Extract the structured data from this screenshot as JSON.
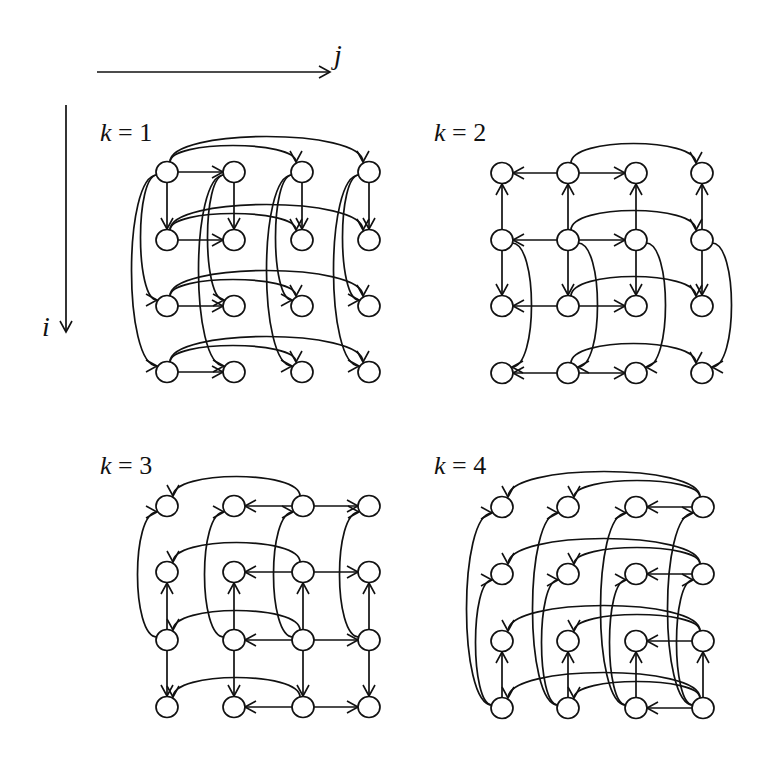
{
  "axes": {
    "j_label": "j",
    "i_label": "i"
  },
  "node_radius": 11,
  "stroke_color": "#111111",
  "panels": [
    {
      "label": "k = 1",
      "label_pos": [
        100,
        141
      ],
      "cols": [
        167,
        234,
        302,
        369
      ],
      "rows": [
        172,
        240,
        306,
        372
      ],
      "edges": [
        {
          "type": "h",
          "from": [
            0,
            0
          ],
          "to": [
            0,
            1
          ]
        },
        {
          "type": "h",
          "from": [
            1,
            0
          ],
          "to": [
            1,
            1
          ]
        },
        {
          "type": "h",
          "from": [
            2,
            0
          ],
          "to": [
            2,
            1
          ]
        },
        {
          "type": "h",
          "from": [
            3,
            0
          ],
          "to": [
            3,
            1
          ]
        },
        {
          "type": "v",
          "from": [
            0,
            0
          ],
          "to": [
            1,
            0
          ]
        },
        {
          "type": "v",
          "from": [
            0,
            1
          ],
          "to": [
            1,
            1
          ]
        },
        {
          "type": "v",
          "from": [
            0,
            2
          ],
          "to": [
            1,
            2
          ]
        },
        {
          "type": "v",
          "from": [
            0,
            3
          ],
          "to": [
            1,
            3
          ]
        },
        {
          "type": "arcH",
          "from": [
            0,
            0
          ],
          "to": [
            0,
            2
          ],
          "h": 22
        },
        {
          "type": "arcH",
          "from": [
            0,
            0
          ],
          "to": [
            0,
            3
          ],
          "h": 34
        },
        {
          "type": "arcH",
          "from": [
            1,
            0
          ],
          "to": [
            1,
            2
          ],
          "h": 22
        },
        {
          "type": "arcH",
          "from": [
            1,
            0
          ],
          "to": [
            1,
            3
          ],
          "h": 34
        },
        {
          "type": "arcH",
          "from": [
            2,
            0
          ],
          "to": [
            2,
            2
          ],
          "h": 22
        },
        {
          "type": "arcH",
          "from": [
            2,
            0
          ],
          "to": [
            2,
            3
          ],
          "h": 34
        },
        {
          "type": "arcH",
          "from": [
            3,
            0
          ],
          "to": [
            3,
            2
          ],
          "h": 22
        },
        {
          "type": "arcH",
          "from": [
            3,
            0
          ],
          "to": [
            3,
            3
          ],
          "h": 34
        },
        {
          "type": "arcV",
          "from": [
            0,
            0
          ],
          "to": [
            2,
            0
          ],
          "w": -22
        },
        {
          "type": "arcV",
          "from": [
            0,
            0
          ],
          "to": [
            3,
            0
          ],
          "w": -34
        },
        {
          "type": "arcV",
          "from": [
            0,
            1
          ],
          "to": [
            2,
            1
          ],
          "w": -22
        },
        {
          "type": "arcV",
          "from": [
            0,
            1
          ],
          "to": [
            3,
            1
          ],
          "w": -34
        },
        {
          "type": "arcV",
          "from": [
            0,
            2
          ],
          "to": [
            2,
            2
          ],
          "w": -22
        },
        {
          "type": "arcV",
          "from": [
            0,
            2
          ],
          "to": [
            3,
            2
          ],
          "w": -34
        },
        {
          "type": "arcV",
          "from": [
            0,
            3
          ],
          "to": [
            2,
            3
          ],
          "w": -22
        },
        {
          "type": "arcV",
          "from": [
            0,
            3
          ],
          "to": [
            3,
            3
          ],
          "w": -34
        }
      ]
    },
    {
      "label": "k = 2",
      "label_pos": [
        434,
        141
      ],
      "cols": [
        502,
        568,
        636,
        702
      ],
      "rows": [
        173,
        240,
        306,
        373
      ],
      "edges": [
        {
          "type": "h",
          "from": [
            0,
            1
          ],
          "to": [
            0,
            0
          ]
        },
        {
          "type": "h",
          "from": [
            0,
            1
          ],
          "to": [
            0,
            2
          ]
        },
        {
          "type": "h",
          "from": [
            1,
            1
          ],
          "to": [
            1,
            0
          ]
        },
        {
          "type": "h",
          "from": [
            1,
            1
          ],
          "to": [
            1,
            2
          ]
        },
        {
          "type": "h",
          "from": [
            2,
            1
          ],
          "to": [
            2,
            0
          ]
        },
        {
          "type": "h",
          "from": [
            2,
            1
          ],
          "to": [
            2,
            2
          ]
        },
        {
          "type": "h",
          "from": [
            3,
            1
          ],
          "to": [
            3,
            0
          ]
        },
        {
          "type": "h",
          "from": [
            3,
            1
          ],
          "to": [
            3,
            2
          ]
        },
        {
          "type": "v",
          "from": [
            1,
            0
          ],
          "to": [
            0,
            0
          ]
        },
        {
          "type": "v",
          "from": [
            1,
            1
          ],
          "to": [
            0,
            1
          ]
        },
        {
          "type": "v",
          "from": [
            1,
            2
          ],
          "to": [
            0,
            2
          ]
        },
        {
          "type": "v",
          "from": [
            1,
            3
          ],
          "to": [
            0,
            3
          ]
        },
        {
          "type": "v",
          "from": [
            1,
            0
          ],
          "to": [
            2,
            0
          ]
        },
        {
          "type": "v",
          "from": [
            1,
            1
          ],
          "to": [
            2,
            1
          ]
        },
        {
          "type": "v",
          "from": [
            1,
            2
          ],
          "to": [
            2,
            2
          ]
        },
        {
          "type": "v",
          "from": [
            1,
            3
          ],
          "to": [
            2,
            3
          ]
        },
        {
          "type": "arcH",
          "from": [
            0,
            1
          ],
          "to": [
            0,
            3
          ],
          "h": 26
        },
        {
          "type": "arcH",
          "from": [
            1,
            1
          ],
          "to": [
            1,
            3
          ],
          "h": 26
        },
        {
          "type": "arcH",
          "from": [
            2,
            1
          ],
          "to": [
            2,
            3
          ],
          "h": 26
        },
        {
          "type": "arcH",
          "from": [
            3,
            1
          ],
          "to": [
            3,
            3
          ],
          "h": 26
        },
        {
          "type": "arcV",
          "from": [
            1,
            0
          ],
          "to": [
            3,
            0
          ],
          "w": 26
        },
        {
          "type": "arcV",
          "from": [
            1,
            1
          ],
          "to": [
            3,
            1
          ],
          "w": 26
        },
        {
          "type": "arcV",
          "from": [
            1,
            2
          ],
          "to": [
            3,
            2
          ],
          "w": 26
        },
        {
          "type": "arcV",
          "from": [
            1,
            3
          ],
          "to": [
            3,
            3
          ],
          "w": 26
        }
      ]
    },
    {
      "label": "k = 3",
      "label_pos": [
        100,
        474
      ],
      "cols": [
        167,
        234,
        303,
        369
      ],
      "rows": [
        506,
        572,
        640,
        707
      ],
      "edges": [
        {
          "type": "h",
          "from": [
            0,
            2
          ],
          "to": [
            0,
            1
          ]
        },
        {
          "type": "h",
          "from": [
            0,
            2
          ],
          "to": [
            0,
            3
          ]
        },
        {
          "type": "h",
          "from": [
            1,
            2
          ],
          "to": [
            1,
            1
          ]
        },
        {
          "type": "h",
          "from": [
            1,
            2
          ],
          "to": [
            1,
            3
          ]
        },
        {
          "type": "h",
          "from": [
            2,
            2
          ],
          "to": [
            2,
            1
          ]
        },
        {
          "type": "h",
          "from": [
            2,
            2
          ],
          "to": [
            2,
            3
          ]
        },
        {
          "type": "h",
          "from": [
            3,
            2
          ],
          "to": [
            3,
            1
          ]
        },
        {
          "type": "h",
          "from": [
            3,
            2
          ],
          "to": [
            3,
            3
          ]
        },
        {
          "type": "v",
          "from": [
            2,
            0
          ],
          "to": [
            1,
            0
          ]
        },
        {
          "type": "v",
          "from": [
            2,
            1
          ],
          "to": [
            1,
            1
          ]
        },
        {
          "type": "v",
          "from": [
            2,
            2
          ],
          "to": [
            1,
            2
          ]
        },
        {
          "type": "v",
          "from": [
            2,
            3
          ],
          "to": [
            1,
            3
          ]
        },
        {
          "type": "v",
          "from": [
            2,
            0
          ],
          "to": [
            3,
            0
          ]
        },
        {
          "type": "v",
          "from": [
            2,
            1
          ],
          "to": [
            3,
            1
          ]
        },
        {
          "type": "v",
          "from": [
            2,
            2
          ],
          "to": [
            3,
            2
          ]
        },
        {
          "type": "v",
          "from": [
            2,
            3
          ],
          "to": [
            3,
            3
          ]
        },
        {
          "type": "arcH",
          "from": [
            0,
            2
          ],
          "to": [
            0,
            0
          ],
          "h": 26
        },
        {
          "type": "arcH",
          "from": [
            1,
            2
          ],
          "to": [
            1,
            0
          ],
          "h": 26
        },
        {
          "type": "arcH",
          "from": [
            2,
            2
          ],
          "to": [
            2,
            0
          ],
          "h": 26
        },
        {
          "type": "arcH",
          "from": [
            3,
            2
          ],
          "to": [
            3,
            0
          ],
          "h": 26
        },
        {
          "type": "arcV",
          "from": [
            2,
            0
          ],
          "to": [
            0,
            0
          ],
          "w": -26
        },
        {
          "type": "arcV",
          "from": [
            2,
            1
          ],
          "to": [
            0,
            1
          ],
          "w": -26
        },
        {
          "type": "arcV",
          "from": [
            2,
            2
          ],
          "to": [
            0,
            2
          ],
          "w": -26
        },
        {
          "type": "arcV",
          "from": [
            2,
            3
          ],
          "to": [
            0,
            3
          ],
          "w": -26
        }
      ]
    },
    {
      "label": "k = 4",
      "label_pos": [
        434,
        474
      ],
      "cols": [
        502,
        568,
        636,
        703
      ],
      "rows": [
        507,
        574,
        641,
        708
      ],
      "edges": [
        {
          "type": "h",
          "from": [
            0,
            3
          ],
          "to": [
            0,
            2
          ]
        },
        {
          "type": "h",
          "from": [
            1,
            3
          ],
          "to": [
            1,
            2
          ]
        },
        {
          "type": "h",
          "from": [
            2,
            3
          ],
          "to": [
            2,
            2
          ]
        },
        {
          "type": "h",
          "from": [
            3,
            3
          ],
          "to": [
            3,
            2
          ]
        },
        {
          "type": "v",
          "from": [
            3,
            0
          ],
          "to": [
            2,
            0
          ]
        },
        {
          "type": "v",
          "from": [
            3,
            1
          ],
          "to": [
            2,
            1
          ]
        },
        {
          "type": "v",
          "from": [
            3,
            2
          ],
          "to": [
            2,
            2
          ]
        },
        {
          "type": "v",
          "from": [
            3,
            3
          ],
          "to": [
            2,
            3
          ]
        },
        {
          "type": "arcH",
          "from": [
            0,
            3
          ],
          "to": [
            0,
            1
          ],
          "h": 22
        },
        {
          "type": "arcH",
          "from": [
            0,
            3
          ],
          "to": [
            0,
            0
          ],
          "h": 34
        },
        {
          "type": "arcH",
          "from": [
            1,
            3
          ],
          "to": [
            1,
            1
          ],
          "h": 22
        },
        {
          "type": "arcH",
          "from": [
            1,
            3
          ],
          "to": [
            1,
            0
          ],
          "h": 34
        },
        {
          "type": "arcH",
          "from": [
            2,
            3
          ],
          "to": [
            2,
            1
          ],
          "h": 22
        },
        {
          "type": "arcH",
          "from": [
            2,
            3
          ],
          "to": [
            2,
            0
          ],
          "h": 34
        },
        {
          "type": "arcH",
          "from": [
            3,
            3
          ],
          "to": [
            3,
            1
          ],
          "h": 22
        },
        {
          "type": "arcH",
          "from": [
            3,
            3
          ],
          "to": [
            3,
            0
          ],
          "h": 34
        },
        {
          "type": "arcV",
          "from": [
            3,
            0
          ],
          "to": [
            1,
            0
          ],
          "w": -22
        },
        {
          "type": "arcV",
          "from": [
            3,
            0
          ],
          "to": [
            0,
            0
          ],
          "w": -34
        },
        {
          "type": "arcV",
          "from": [
            3,
            1
          ],
          "to": [
            1,
            1
          ],
          "w": -22
        },
        {
          "type": "arcV",
          "from": [
            3,
            1
          ],
          "to": [
            0,
            1
          ],
          "w": -34
        },
        {
          "type": "arcV",
          "from": [
            3,
            2
          ],
          "to": [
            1,
            2
          ],
          "w": -22
        },
        {
          "type": "arcV",
          "from": [
            3,
            2
          ],
          "to": [
            0,
            2
          ],
          "w": -34
        },
        {
          "type": "arcV",
          "from": [
            3,
            3
          ],
          "to": [
            1,
            3
          ],
          "w": -22
        },
        {
          "type": "arcV",
          "from": [
            3,
            3
          ],
          "to": [
            0,
            3
          ],
          "w": -34
        }
      ]
    }
  ]
}
